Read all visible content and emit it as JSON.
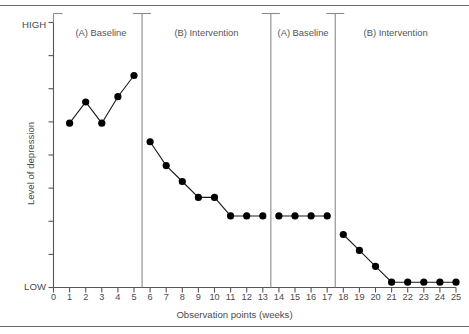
{
  "chart_data": {
    "type": "line",
    "title": "",
    "xlabel": "Observation points (weeks)",
    "ylabel": "Level of depression",
    "ylim": [
      0,
      100
    ],
    "ytick_labels": {
      "high": "HIGH",
      "low": "LOW"
    },
    "ytick_count": 8,
    "grid": false,
    "legend": "none",
    "xlim": [
      0,
      25
    ],
    "xtick_labels": [
      "0",
      "1",
      "2",
      "3",
      "4",
      "5",
      "6",
      "7",
      "8",
      "9",
      "10",
      "11",
      "12",
      "13",
      "14",
      "15",
      "16",
      "17",
      "18",
      "19",
      "20",
      "21",
      "22",
      "23",
      "24",
      "25"
    ],
    "phases": [
      {
        "label": "(A) Baseline",
        "start": 1,
        "end": 5,
        "divider_after": 5.5
      },
      {
        "label": "(B) Intervention",
        "start": 6,
        "end": 13,
        "divider_after": 13.5
      },
      {
        "label": "(A) Baseline",
        "start": 14,
        "end": 17,
        "divider_after": 17.5
      },
      {
        "label": "(B) Intervention",
        "start": 18,
        "end": 25,
        "divider_after": null
      }
    ],
    "series": [
      {
        "name": "Level of depression",
        "x": [
          1,
          2,
          3,
          4,
          5,
          6,
          7,
          8,
          9,
          10,
          11,
          12,
          13,
          14,
          15,
          16,
          17,
          18,
          19,
          20,
          21,
          22,
          23,
          24,
          25
        ],
        "values": [
          62,
          70,
          62,
          72,
          80,
          55,
          46,
          40,
          34,
          34,
          27,
          27,
          27,
          27,
          27,
          27,
          27,
          20,
          14,
          8,
          2,
          2,
          2,
          2,
          2
        ],
        "segments": [
          [
            1,
            5
          ],
          [
            6,
            13
          ],
          [
            14,
            17
          ],
          [
            18,
            25
          ]
        ]
      }
    ]
  },
  "figure": {
    "top_rule": true,
    "bottom_rule": true
  }
}
